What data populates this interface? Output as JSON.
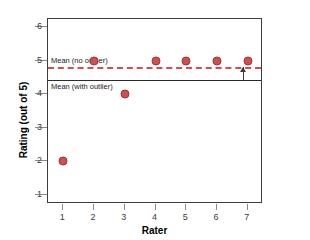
{
  "chart_data": {
    "type": "scatter",
    "title": "",
    "xlabel": "Rater",
    "ylabel": "Rating (out of 5)",
    "x": [
      1,
      2,
      3,
      4,
      5,
      6,
      7
    ],
    "values": [
      2,
      5,
      4,
      5,
      5,
      5,
      5
    ],
    "xlim": [
      0.5,
      7.5
    ],
    "ylim": [
      0.72,
      6.25
    ],
    "xticks": [
      "1",
      "2",
      "3",
      "4",
      "5",
      "6",
      "7"
    ],
    "yticks": [
      "1",
      "2",
      "3",
      "4",
      "5",
      "6"
    ],
    "grid": false,
    "legend": "none",
    "point_color": "#cf4f4f",
    "reference_lines": [
      {
        "name": "mean-no-outlier",
        "label": "Mean (no outlier)",
        "value": 4.83,
        "style": "dashed",
        "color": "#cf4f4f"
      },
      {
        "name": "mean-with-outlier",
        "label": "Mean (with outlier)",
        "value": 4.43,
        "style": "solid",
        "color": "#2b2b2b"
      }
    ],
    "annotations": [
      {
        "name": "difference-arrow",
        "type": "arrow",
        "direction": "up",
        "x": 6.85,
        "from": 4.43,
        "to": 4.83
      }
    ]
  }
}
